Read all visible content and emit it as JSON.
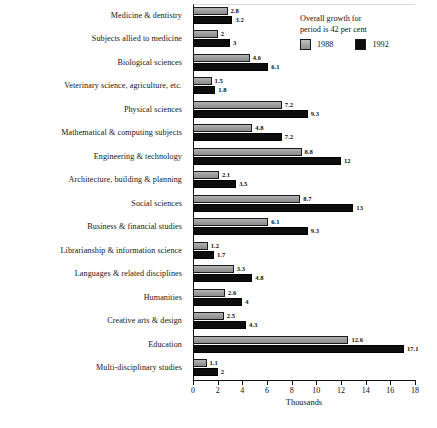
{
  "chart_data": {
    "type": "bar",
    "orientation": "horizontal",
    "title": "",
    "xlabel": "Thousands",
    "ylabel": "",
    "xlim": [
      0,
      18
    ],
    "xticks": [
      0,
      2,
      4,
      6,
      8,
      10,
      12,
      14,
      16,
      18
    ],
    "grid": false,
    "legend_position": "top-right",
    "annotation": {
      "line1": "Overall growth for",
      "line2": "period is 42 per cent"
    },
    "categories": [
      "Medicine & dentistry",
      "Subjects allied to medicine",
      "Biological sciences",
      "Veterinary science, agriculture, etc.",
      "Physical sciences",
      "Mathematical & computing subjects",
      "Engineering & technology",
      "Architecture, building & planning",
      "Social sciences",
      "Business & financial studies",
      "Librarianship & information science",
      "Languages & related disciplines",
      "Humanities",
      "Creative arts & design",
      "Education",
      "Multi-disciplinary studies"
    ],
    "series": [
      {
        "name": "1988",
        "color": "#9e9e9e",
        "values": [
          2.8,
          2,
          4.6,
          1.5,
          7.2,
          4.8,
          8.8,
          2.1,
          8.7,
          6.1,
          1.2,
          3.3,
          2.6,
          2.5,
          12.6,
          1.1
        ],
        "labels": [
          "2.8",
          "2",
          "4.6",
          "1.5",
          "7.2",
          "4.8",
          "8.8",
          "2.1",
          "8.7",
          "6.1",
          "1.2",
          "3.3",
          "2.6",
          "2.5",
          "12.6",
          "1.1"
        ]
      },
      {
        "name": "1992",
        "color": "#0d0d0d",
        "values": [
          3.2,
          3,
          6.1,
          1.8,
          9.3,
          7.2,
          12,
          3.5,
          13,
          9.3,
          1.7,
          4.8,
          4,
          4.3,
          17.1,
          2
        ],
        "labels": [
          "3.2",
          "3",
          "6.1",
          "1.8",
          "9.3",
          "7.2",
          "12",
          "3.5",
          "13",
          "9.3",
          "1.7",
          "4.8",
          "4",
          "4.3",
          "17.1",
          "2"
        ]
      }
    ]
  }
}
